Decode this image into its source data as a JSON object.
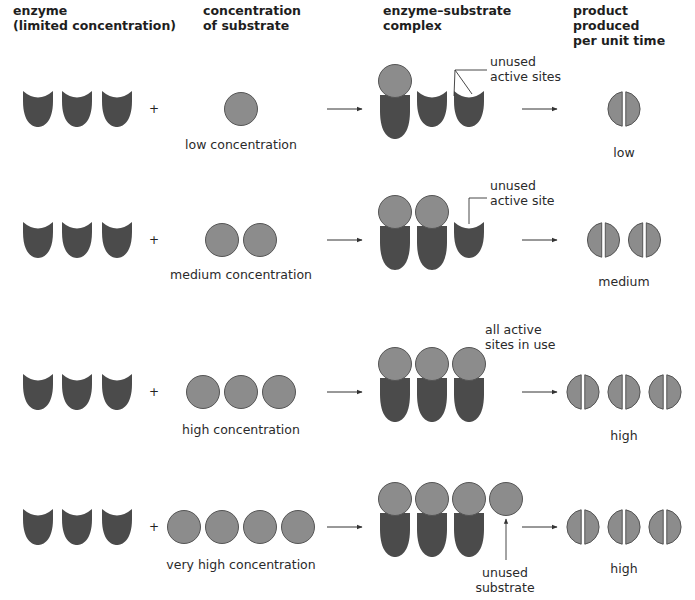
{
  "headers": {
    "enzyme": [
      "enzyme",
      "(limited concentration)"
    ],
    "substrate": [
      "concentration",
      "of substrate"
    ],
    "complex": [
      "enzyme–substrate",
      "complex"
    ],
    "product": [
      "product produced",
      "per unit time"
    ]
  },
  "colors": {
    "enzyme": "#4b4b4b",
    "substrate": "#8c8c8c",
    "substrate_stroke": "#555555",
    "line": "#333333"
  },
  "rows": [
    {
      "substrate_label": "low concentration",
      "substrate_count": 1,
      "bound": 1,
      "unused_substrate": 0,
      "product_count": 1,
      "product_label": "low",
      "annotation": [
        "unused",
        "active sites"
      ]
    },
    {
      "substrate_label": "medium concentration",
      "substrate_count": 2,
      "bound": 2,
      "unused_substrate": 0,
      "product_count": 2,
      "product_label": "medium",
      "annotation": [
        "unused",
        "active site"
      ]
    },
    {
      "substrate_label": "high concentration",
      "substrate_count": 3,
      "bound": 3,
      "unused_substrate": 0,
      "product_count": 3,
      "product_label": "high",
      "annotation": [
        "all active",
        "sites in use"
      ]
    },
    {
      "substrate_label": "very high concentration",
      "substrate_count": 4,
      "bound": 3,
      "unused_substrate": 1,
      "product_count": 3,
      "product_label": "high",
      "annotation": [
        "unused",
        "substrate"
      ]
    }
  ],
  "symbols": {
    "plus": "+"
  }
}
